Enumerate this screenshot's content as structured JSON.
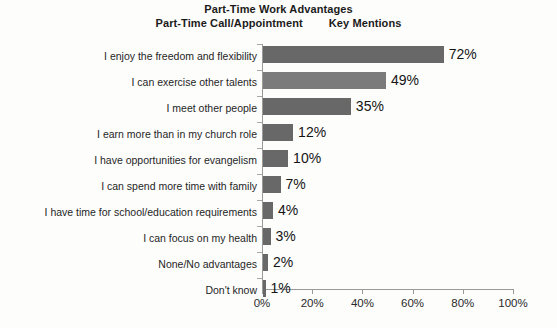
{
  "title": {
    "line1": "Part-Time Work Advantages",
    "line2_left": "Part-Time Call/Appointment",
    "line2_right": "Key Mentions"
  },
  "colors": {
    "bar": "#686868",
    "bar_alt": "#7b7b7b",
    "axis": "#9a9a9a",
    "text": "#1f1f1f",
    "background": "#fdfdfc"
  },
  "chart_data": {
    "type": "bar",
    "orientation": "horizontal",
    "title": "Part-Time Work Advantages",
    "subtitle": "Part-Time Call/Appointment     Key Mentions",
    "xlabel": "",
    "ylabel": "",
    "xlim": [
      0,
      100
    ],
    "xticks": [
      0,
      20,
      40,
      60,
      80,
      100
    ],
    "xtick_labels": [
      "0%",
      "20%",
      "40%",
      "60%",
      "80%",
      "100%"
    ],
    "grid": false,
    "legend": false,
    "units": "%",
    "categories": [
      "I enjoy the freedom and flexibility",
      "I can exercise other talents",
      "I meet other people",
      "I earn more than in my church role",
      "I have opportunities for evangelism",
      "I can spend more time with family",
      "I have time for school/education requirements",
      "I can focus on my health",
      "None/No advantages",
      "Don't know"
    ],
    "values": [
      72,
      49,
      35,
      12,
      10,
      7,
      4,
      3,
      2,
      1
    ],
    "data_labels": [
      "72%",
      "49%",
      "35%",
      "12%",
      "10%",
      "7%",
      "4%",
      "3%",
      "2%",
      "1%"
    ]
  }
}
